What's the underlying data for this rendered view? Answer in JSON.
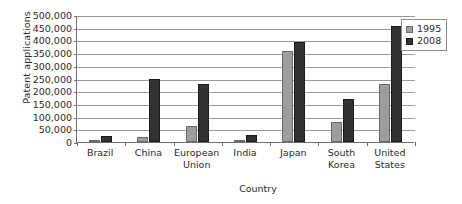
{
  "chart_data": {
    "type": "bar",
    "title": "",
    "xlabel": "Country",
    "ylabel": "Patent applications",
    "categories": [
      "Brazil",
      "China",
      "European Union",
      "India",
      "Japan",
      "South Korea",
      "United States"
    ],
    "series": [
      {
        "name": "1995",
        "color": "#9d9d9d",
        "values": [
          8000,
          19000,
          62000,
          8000,
          359000,
          79000,
          230000
        ]
      },
      {
        "name": "2008",
        "color": "#333333",
        "values": [
          23000,
          248000,
          227000,
          29000,
          392000,
          171000,
          457000
        ]
      }
    ],
    "ylim": [
      0,
      500000
    ],
    "ytick_step": 50000,
    "ytick_labels": [
      "500,000",
      "450,000",
      "400,000",
      "350,000",
      "300,000",
      "250,000",
      "200,000",
      "150,000",
      "100,000",
      "50,000",
      "0"
    ],
    "ytick_values": [
      500000,
      450000,
      400000,
      350000,
      300000,
      250000,
      200000,
      150000,
      100000,
      50000,
      0
    ],
    "grid": true,
    "legend_position": "top-right",
    "legend_entries": [
      "1995",
      "2008"
    ]
  },
  "axis": {
    "y_title": "Patent applications",
    "x_title": "Country"
  },
  "x_categories": [
    {
      "line1": "Brazil",
      "line2": ""
    },
    {
      "line1": "China",
      "line2": ""
    },
    {
      "line1": "European",
      "line2": "Union"
    },
    {
      "line1": "India",
      "line2": ""
    },
    {
      "line1": "Japan",
      "line2": ""
    },
    {
      "line1": "South",
      "line2": "Korea"
    },
    {
      "line1": "United",
      "line2": "States"
    }
  ],
  "legend": {
    "items": [
      {
        "label": "1995",
        "color": "#9d9d9d"
      },
      {
        "label": "2008",
        "color": "#333333"
      }
    ]
  }
}
